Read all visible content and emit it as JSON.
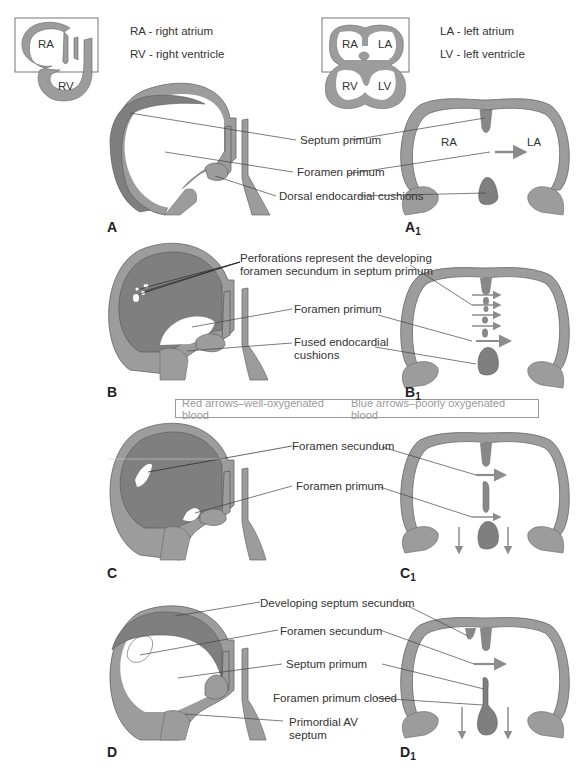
{
  "figure": {
    "key": {
      "ra": "RA - right atrium",
      "rv": "RV - right ventricle",
      "la": "LA - left atrium",
      "lv": "LV - left ventricle"
    },
    "inset_labels": {
      "left": [
        "RA",
        "RV"
      ],
      "right": [
        "RA",
        "LA",
        "RV",
        "LV"
      ]
    },
    "chamber_labels": {
      "ra": "RA",
      "la": "LA"
    },
    "panels": {
      "a": {
        "letter": "A",
        "labels": [
          "Septum primum",
          "Foramen primum",
          "Dorsal endocardial cushions"
        ]
      },
      "a1": {
        "letter": "A",
        "sub": "1"
      },
      "b": {
        "letter": "B",
        "labels": [
          "Perforations represent the developing",
          "foramen secundum in septum primum",
          "Foramen primum",
          "Fused endocardial",
          "cushions"
        ]
      },
      "b1": {
        "letter": "B",
        "sub": "1"
      },
      "c": {
        "letter": "C",
        "labels": [
          "Foramen secundum",
          "Foramen primum"
        ]
      },
      "c1": {
        "letter": "C",
        "sub": "1"
      },
      "d": {
        "letter": "D",
        "labels": [
          "Developing septum secundum",
          "Foramen secundum",
          "Septum primum",
          "Foramen primum closed",
          "Primordial AV",
          "septum"
        ]
      },
      "d1": {
        "letter": "D",
        "sub": "1"
      }
    },
    "legend": {
      "red": "Red arrows–well-oxygenated blood",
      "blue": "Blue arrows–poorly oxygenated blood"
    },
    "colors": {
      "wall": "#9c9c9c",
      "septum_dark": "#7f7f7f",
      "outline": "#555555",
      "arrow": "#8c8c8c",
      "legend_text": "#9a9a9a"
    }
  }
}
